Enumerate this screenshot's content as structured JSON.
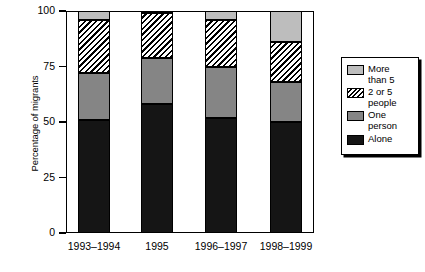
{
  "chart_data": {
    "type": "bar",
    "subtype": "stacked-percentage",
    "title": "",
    "xlabel": "",
    "ylabel": "Percentage of migrants",
    "ylim": [
      0,
      100
    ],
    "yticks": [
      0,
      25,
      50,
      75,
      100
    ],
    "grid": false,
    "legend_position": "right",
    "categories": [
      "1993–1994",
      "1995",
      "1996–1997",
      "1998–1999"
    ],
    "series": [
      {
        "name": "Alone",
        "values": [
          51,
          58,
          52,
          50
        ]
      },
      {
        "name": "One person",
        "values": [
          21,
          21,
          23,
          18
        ]
      },
      {
        "name": "2 or 5 people",
        "values": [
          24,
          20,
          21,
          18
        ]
      },
      {
        "name": "More than 5",
        "values": [
          4,
          1,
          4,
          14
        ]
      }
    ],
    "colors": {
      "alone": "#151515",
      "one_person": "#858585",
      "two_or_five_people": "#ffffff",
      "more_than_5": "#bdbdbd",
      "axis": "#000000"
    }
  },
  "axes": {
    "y_title": "Percentage of migrants",
    "y_tick_labels": [
      "100",
      "75",
      "50",
      "25",
      "0"
    ],
    "x_tick_labels": [
      "1993–1994",
      "1995",
      "1996–1997",
      "1998–1999"
    ]
  },
  "legend": {
    "items": [
      {
        "label": "More\nthan 5",
        "swatch": "light-gray-swatch"
      },
      {
        "label": "2 or 5\npeople",
        "swatch": "hatched-swatch"
      },
      {
        "label": "One\nperson",
        "swatch": "mid-gray-swatch"
      },
      {
        "label": "Alone",
        "swatch": "black-swatch"
      }
    ]
  }
}
